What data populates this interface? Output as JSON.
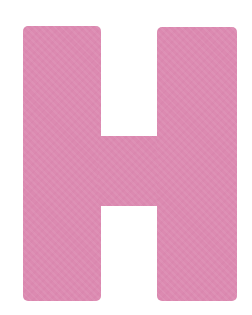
{
  "image": {
    "letter": "H",
    "description": "Large pink block letter H on white background",
    "colors": {
      "fill": "#dc8ab1",
      "background": "#ffffff"
    }
  }
}
